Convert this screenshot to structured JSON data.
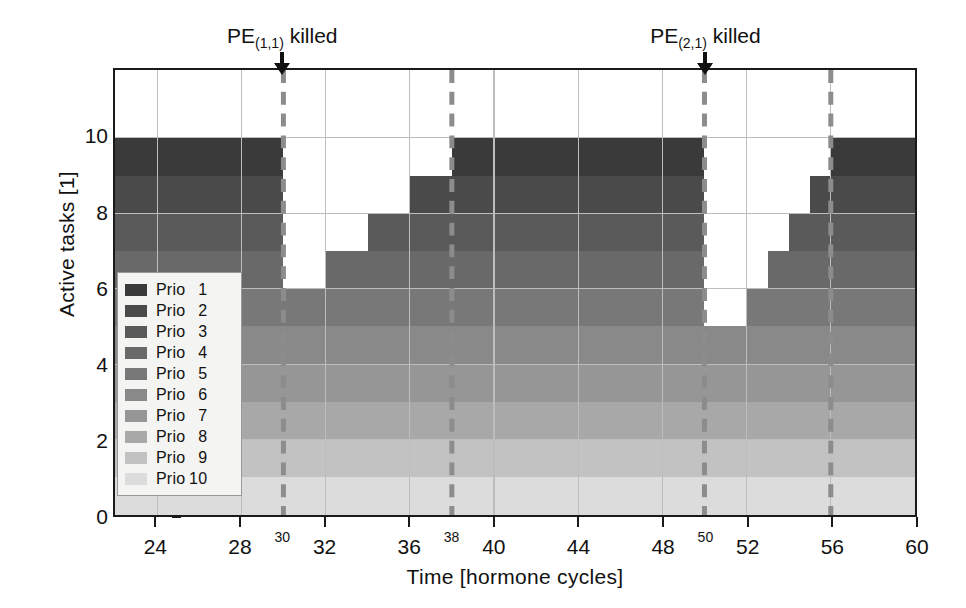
{
  "chart_data": {
    "type": "area",
    "title": "",
    "xlabel": "Time [hormone cycles]",
    "ylabel": "Active tasks [1]",
    "xlim": [
      22,
      60
    ],
    "ylim": [
      0,
      11.8
    ],
    "yaxis_max_label": 10,
    "grid": true,
    "legend_position": "inner-left",
    "xticks": [
      24,
      28,
      32,
      36,
      40,
      44,
      48,
      52,
      56,
      60
    ],
    "xticks_minor_labeled": [
      30,
      38,
      50,
      56
    ],
    "yticks": [
      0,
      2,
      4,
      6,
      8,
      10
    ],
    "series": [
      {
        "name": "Prio  1",
        "color": "#3a3a3a"
      },
      {
        "name": "Prio  2",
        "color": "#4a4a4a"
      },
      {
        "name": "Prio  3",
        "color": "#5a5a5a"
      },
      {
        "name": "Prio  4",
        "color": "#696969"
      },
      {
        "name": "Prio  5",
        "color": "#787878"
      },
      {
        "name": "Prio  6",
        "color": "#898989"
      },
      {
        "name": "Prio  7",
        "color": "#969696"
      },
      {
        "name": "Prio  8",
        "color": "#a8a8a8"
      },
      {
        "name": "Prio  9",
        "color": "#c2c2c2"
      },
      {
        "name": "Prio 10",
        "color": "#dcdcdc"
      }
    ],
    "total_active_tasks": [
      {
        "x": 22,
        "value": 10
      },
      {
        "x": 30,
        "value": 6
      },
      {
        "x": 32,
        "value": 7
      },
      {
        "x": 34,
        "value": 8
      },
      {
        "x": 36,
        "value": 9
      },
      {
        "x": 38,
        "value": 10
      },
      {
        "x": 50,
        "value": 5
      },
      {
        "x": 52,
        "value": 6
      },
      {
        "x": 53,
        "value": 7
      },
      {
        "x": 54,
        "value": 8
      },
      {
        "x": 55,
        "value": 9
      },
      {
        "x": 56,
        "value": 10
      },
      {
        "x": 60,
        "value": 10
      }
    ],
    "stack_steps": [
      {
        "x0": 22,
        "x1": 30,
        "top": 10,
        "bottom": 0
      },
      {
        "x0": 30,
        "x1": 32,
        "top": 6,
        "bottom": 0
      },
      {
        "x0": 32,
        "x1": 34,
        "top": 7,
        "bottom": 0
      },
      {
        "x0": 34,
        "x1": 36,
        "top": 8,
        "bottom": 0
      },
      {
        "x0": 36,
        "x1": 38,
        "top": 9,
        "bottom": 0
      },
      {
        "x0": 38,
        "x1": 50,
        "top": 10,
        "bottom": 0
      },
      {
        "x0": 50,
        "x1": 52,
        "top": 5,
        "bottom": 0
      },
      {
        "x0": 52,
        "x1": 53,
        "top": 6,
        "bottom": 0
      },
      {
        "x0": 53,
        "x1": 54,
        "top": 7,
        "bottom": 0
      },
      {
        "x0": 54,
        "x1": 55,
        "top": 8,
        "bottom": 0
      },
      {
        "x0": 55,
        "x1": 56,
        "top": 9,
        "bottom": 0
      },
      {
        "x0": 56,
        "x1": 60,
        "top": 10,
        "bottom": 0
      }
    ],
    "event_markers": [
      {
        "x": 30,
        "label": "PE",
        "sub": "(1,1)",
        "suffix": " killed",
        "style": "solid-arrow"
      },
      {
        "x": 50,
        "label": "PE",
        "sub": "(2,1)",
        "suffix": " killed",
        "style": "solid-arrow"
      }
    ],
    "dashed_lines": [
      {
        "x": 30,
        "color": "#8c8c8c"
      },
      {
        "x": 38,
        "color": "#8c8c8c"
      },
      {
        "x": 50,
        "color": "#8c8c8c"
      },
      {
        "x": 56,
        "color": "#8c8c8c"
      }
    ],
    "colors": {
      "axis": "#1a1a1a",
      "grid": "#bdbdbd",
      "background": "#ffffff",
      "dashed": "#8c8c8c",
      "legend_bg": "#f4f4f2",
      "legend_border": "#9a9a9a"
    }
  },
  "axes": {
    "ylabel": "Active tasks [1]",
    "xlabel": "Time [hormone cycles]"
  },
  "legend": {
    "items": [
      {
        "label": "Prio",
        "num": "1"
      },
      {
        "label": "Prio",
        "num": "2"
      },
      {
        "label": "Prio",
        "num": "3"
      },
      {
        "label": "Prio",
        "num": "4"
      },
      {
        "label": "Prio",
        "num": "5"
      },
      {
        "label": "Prio",
        "num": "6"
      },
      {
        "label": "Prio",
        "num": "7"
      },
      {
        "label": "Prio",
        "num": "8"
      },
      {
        "label": "Prio",
        "num": "9"
      },
      {
        "label": "Prio",
        "num": "10"
      }
    ]
  },
  "annotations": [
    {
      "text_main": "PE",
      "text_sub": "(1,1)",
      "text_tail": " killed"
    },
    {
      "text_main": "PE",
      "text_sub": "(2,1)",
      "text_tail": " killed"
    }
  ]
}
